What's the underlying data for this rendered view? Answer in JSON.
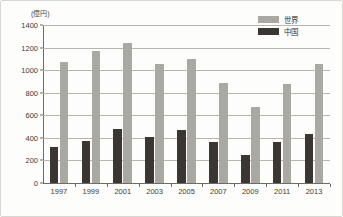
{
  "chart_data": {
    "type": "bar",
    "title": "",
    "subtitle": "",
    "unit_label": "(億円)",
    "xlabel": "",
    "ylabel": "",
    "categories": [
      "1997",
      "1999",
      "2001",
      "2003",
      "2005",
      "2007",
      "2009",
      "2011",
      "2013"
    ],
    "series": [
      {
        "name": "世界",
        "color": "#a9a8a2",
        "values": [
          1075,
          1170,
          1245,
          1055,
          1100,
          890,
          670,
          875,
          1055
        ]
      },
      {
        "name": "中国",
        "color": "#3b3631",
        "values": [
          315,
          370,
          480,
          405,
          470,
          360,
          250,
          360,
          435
        ]
      }
    ],
    "ylim": [
      0,
      1400
    ],
    "yticks": [
      0,
      200,
      400,
      600,
      800,
      1000,
      1200,
      1400
    ],
    "ytick_labels": [
      "0",
      "200",
      "400",
      "600",
      "800",
      "1000",
      "1200",
      "1400"
    ],
    "grid": true,
    "grid_axis": "y",
    "legend_position": "top-right"
  },
  "legend": {
    "entries": [
      {
        "label": "世界",
        "color": "#a9a8a2"
      },
      {
        "label": "中国",
        "color": "#3b3631"
      }
    ]
  }
}
